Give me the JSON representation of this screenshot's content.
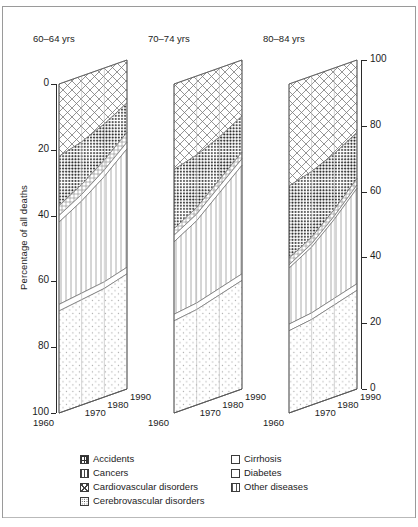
{
  "chart_data": {
    "type": "area",
    "title": "",
    "ylabel": "Percentage of all deaths",
    "xlabel": "",
    "ylim": [
      0,
      100
    ],
    "y_axis_left": {
      "labels": [
        "0",
        "20",
        "40",
        "60",
        "80",
        "100"
      ],
      "values": [
        0,
        20,
        40,
        60,
        80,
        100
      ],
      "direction": "top-to-bottom"
    },
    "y_axis_right": {
      "labels": [
        "100",
        "80",
        "60",
        "40",
        "20",
        "0"
      ],
      "values": [
        100,
        80,
        60,
        40,
        20,
        0
      ],
      "direction": "top-to-bottom"
    },
    "x": [
      1960,
      1970,
      1980,
      1990
    ],
    "xtick_labels": [
      "1960",
      "1970",
      "1980",
      "1990"
    ],
    "grid": true,
    "legend_position": "bottom",
    "stack_order": [
      "Cardiovascular disorders",
      "Cerebrovascular disorders",
      "Accidents",
      "Cirrhosis",
      "Cancers",
      "Diabetes",
      "Other diseases"
    ],
    "panels": [
      {
        "name": "60-64 yrs",
        "series": [
          {
            "name": "Cardiovascular disorders",
            "values": [
              22,
              20,
              17,
              13
            ]
          },
          {
            "name": "Cerebrovascular disorders",
            "values": [
              15,
              13,
              11,
              9
            ]
          },
          {
            "name": "Accidents",
            "values": [
              3,
              3,
              3,
              3
            ]
          },
          {
            "name": "Cirrhosis",
            "values": [
              2,
              2,
              2,
              2
            ]
          },
          {
            "name": "Cancers",
            "values": [
              25,
              28,
              32,
              36
            ]
          },
          {
            "name": "Diabetes",
            "values": [
              2,
              2,
              2,
              2
            ]
          },
          {
            "name": "Other diseases",
            "values": [
              31,
              32,
              33,
              35
            ]
          }
        ]
      },
      {
        "name": "70-74 yrs",
        "series": [
          {
            "name": "Cardiovascular disorders",
            "values": [
              26,
              24,
              21,
              17
            ]
          },
          {
            "name": "Cerebrovascular disorders",
            "values": [
              18,
              16,
              13,
              11
            ]
          },
          {
            "name": "Accidents",
            "values": [
              2,
              2,
              2,
              2
            ]
          },
          {
            "name": "Cirrhosis",
            "values": [
              2,
              2,
              2,
              2
            ]
          },
          {
            "name": "Cancers",
            "values": [
              22,
              25,
              29,
              33
            ]
          },
          {
            "name": "Diabetes",
            "values": [
              2,
              2,
              2,
              2
            ]
          },
          {
            "name": "Other diseases",
            "values": [
              28,
              29,
              31,
              33
            ]
          }
        ]
      },
      {
        "name": "80-84 yrs",
        "series": [
          {
            "name": "Cardiovascular disorders",
            "values": [
              31,
              29,
              26,
              22
            ]
          },
          {
            "name": "Cerebrovascular disorders",
            "values": [
              22,
              20,
              17,
              14
            ]
          },
          {
            "name": "Accidents",
            "values": [
              2,
              2,
              2,
              2
            ]
          },
          {
            "name": "Cirrhosis",
            "values": [
              1,
              1,
              1,
              1
            ]
          },
          {
            "name": "Cancers",
            "values": [
              17,
              20,
              24,
              29
            ]
          },
          {
            "name": "Diabetes",
            "values": [
              2,
              2,
              2,
              2
            ]
          },
          {
            "name": "Other diseases",
            "values": [
              25,
              26,
              28,
              30
            ]
          }
        ]
      }
    ],
    "legend": [
      {
        "label": "Accidents",
        "pattern": "accidents-hatch"
      },
      {
        "label": "Cancers",
        "pattern": "vertical-lines"
      },
      {
        "label": "Cardiovascular disorders",
        "pattern": "cross-hatch"
      },
      {
        "label": "Cerebrovascular disorders",
        "pattern": "dense-dots"
      },
      {
        "label": "Cirrhosis",
        "pattern": "blank"
      },
      {
        "label": "Diabetes",
        "pattern": "blank"
      },
      {
        "label": "Other diseases",
        "pattern": "sparse-dots"
      }
    ]
  },
  "axis": {
    "ylabel": "Percentage of all deaths",
    "left_ticks": [
      "0",
      "20",
      "40",
      "60",
      "80",
      "100"
    ],
    "right_ticks": [
      "100",
      "80",
      "60",
      "40",
      "20",
      "0"
    ]
  },
  "panels": [
    {
      "title": "60-64 yrs",
      "years": [
        "1960",
        "1970",
        "1980",
        "1990"
      ]
    },
    {
      "title": "70-74 yrs",
      "years": [
        "1960",
        "1970",
        "1980",
        "1990"
      ]
    },
    {
      "title": "80-84 yrs",
      "years": [
        "1960",
        "1970",
        "1980",
        "1990"
      ]
    }
  ],
  "legend": {
    "col1": [
      {
        "label": "Accidents",
        "swatch": "accidents-swatch-icon"
      },
      {
        "label": "Cancers",
        "swatch": "cancers-swatch-icon"
      },
      {
        "label": "Cardiovascular disorders",
        "swatch": "cardiovascular-swatch-icon"
      },
      {
        "label": "Cerebrovascular disorders",
        "swatch": "cerebrovascular-swatch-icon"
      }
    ],
    "col2": [
      {
        "label": "Cirrhosis",
        "swatch": "cirrhosis-swatch-icon"
      },
      {
        "label": "Diabetes",
        "swatch": "diabetes-swatch-icon"
      },
      {
        "label": "Other diseases",
        "swatch": "other-diseases-swatch-icon"
      }
    ]
  },
  "colors": {
    "ink": "#1c1c1c",
    "line": "#6e6e6e",
    "frame": "#9a9a9a",
    "background": "#ffffff"
  }
}
